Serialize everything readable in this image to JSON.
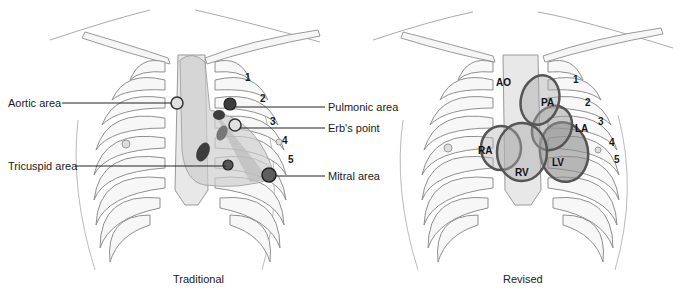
{
  "left_panel": {
    "caption": "Traditional",
    "labels": {
      "aortic": "Aortic area",
      "pulmonic": "Pulmonic area",
      "erbs": "Erb's point",
      "tricuspid": "Tricuspid area",
      "mitral": "Mitral area"
    },
    "rib_numbers": [
      "1",
      "2",
      "3",
      "4",
      "5"
    ]
  },
  "right_panel": {
    "caption": "Revised",
    "region_labels": {
      "ao": "AO",
      "pa": "PA",
      "la": "LA",
      "ra": "RA",
      "rv": "RV",
      "lv": "LV"
    },
    "rib_numbers": [
      "1",
      "2",
      "3",
      "4",
      "5"
    ]
  },
  "colors": {
    "bone": "#f4f4f4",
    "bone_outline": "#9a9a9a",
    "heart_fill": "#bdbdbd",
    "marker_dark": "#4a4a4a",
    "ring": "#5a5a5a"
  }
}
